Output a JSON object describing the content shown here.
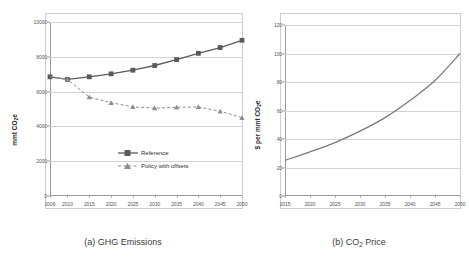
{
  "figure": {
    "panels": [
      {
        "id": "a",
        "caption_prefix": "(a)",
        "caption_text": "GHG Emissions"
      },
      {
        "id": "b",
        "caption_prefix": "(b)",
        "caption_text": "Price",
        "caption_formula": "CO",
        "caption_formula_sub": "2"
      }
    ]
  },
  "chart_data": [
    {
      "type": "line",
      "panel": "a",
      "title": "(a) GHG Emissions",
      "xlabel": "",
      "ylabel": "mmt CO2e",
      "ylabel_main": "mmt CO",
      "ylabel_sub": "2",
      "ylabel_tail": "e",
      "xlim": [
        2006,
        2050
      ],
      "ylim": [
        0,
        10000
      ],
      "grid": true,
      "legend_position": "inside-lower-right",
      "ytick_values": [
        0,
        2000,
        4000,
        6000,
        8000,
        10000
      ],
      "ytick_labels": [
        "0",
        "2000",
        "4000",
        "6000",
        "8000",
        "10000"
      ],
      "xtick_values": [
        2006,
        2010,
        2015,
        2020,
        2025,
        2030,
        2035,
        2040,
        2045,
        2050
      ],
      "xtick_labels": [
        "2006",
        "2010",
        "2015",
        "2020",
        "2025",
        "2030",
        "2035",
        "2040",
        "2045",
        "2050"
      ],
      "x": [
        2006,
        2010,
        2015,
        2020,
        2025,
        2030,
        2035,
        2040,
        2045,
        2050
      ],
      "series": [
        {
          "name": "Reference",
          "style": "solid",
          "marker": "square",
          "color": "#5a5a5a",
          "values": [
            6850,
            6700,
            6850,
            7020,
            7230,
            7500,
            7840,
            8200,
            8530,
            8950
          ]
        },
        {
          "name": "Policy with offsets",
          "style": "dashed",
          "marker": "triangle",
          "color": "#8e8e8e",
          "values": [
            6850,
            6700,
            5680,
            5360,
            5120,
            5050,
            5100,
            5120,
            4870,
            4500
          ]
        }
      ]
    },
    {
      "type": "line",
      "panel": "b",
      "title": "(b) CO2 Price",
      "xlabel": "",
      "ylabel": "$ per mmt CO2e",
      "ylabel_main": "$ per mmt CO",
      "ylabel_sub": "2",
      "ylabel_tail": "e",
      "xlim": [
        2015,
        2050
      ],
      "ylim": [
        0,
        120
      ],
      "grid": true,
      "legend_position": "none",
      "ytick_values": [
        0,
        20,
        40,
        60,
        80,
        100,
        120
      ],
      "ytick_labels": [
        "0",
        "20",
        "40",
        "60",
        "80",
        "100",
        "120"
      ],
      "xtick_values": [
        2015,
        2020,
        2025,
        2030,
        2035,
        2040,
        2045,
        2050
      ],
      "xtick_labels": [
        "2015",
        "2020",
        "2025",
        "2030",
        "2035",
        "2040",
        "2045",
        "2050"
      ],
      "x": [
        2015,
        2020,
        2025,
        2030,
        2035,
        2040,
        2045,
        2050
      ],
      "series": [
        {
          "name": "CO2 Price",
          "style": "solid",
          "marker": "none",
          "color": "#7a7a7a",
          "values": [
            25,
            31,
            37.5,
            45.5,
            55,
            67,
            81,
            100
          ]
        }
      ]
    }
  ]
}
